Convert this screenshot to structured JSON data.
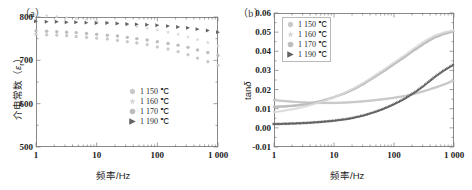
{
  "figure": {
    "panel_a_tag": "（a）",
    "panel_b_tag": "（b）"
  },
  "series_colors": {
    "t1150": "#c9c9c9",
    "t1160": "#d8d8d8",
    "t1170": "#bdbdbd",
    "t1190": "#626262"
  },
  "legend": {
    "items": [
      {
        "label": "1 150 ℃",
        "marker": "hexagon-marker",
        "color": "#c9c9c9"
      },
      {
        "label": "1 160 ℃",
        "marker": "star-marker",
        "color": "#d8d8d8"
      },
      {
        "label": "1 170 ℃",
        "marker": "circle-marker",
        "color": "#bdbdbd"
      },
      {
        "label": "1 190 ℃",
        "marker": "right-triangle-marker",
        "color": "#626262"
      }
    ]
  },
  "chart_data": [
    {
      "type": "scatter",
      "panel": "a",
      "title": "",
      "xlabel": "频率/Hz",
      "ylabel": "介电常数（ε_r）",
      "xscale": "log",
      "xlim": [
        1,
        1000
      ],
      "ylim": [
        500,
        800
      ],
      "xticks": [
        1,
        10,
        100,
        1000
      ],
      "xticklabels": [
        "1",
        "10",
        "100",
        "1 000"
      ],
      "yticks": [
        500,
        600,
        700,
        800
      ],
      "yticklabels": [
        "500",
        "600",
        "700",
        "800"
      ],
      "grid": false,
      "legend_position": "lower-right",
      "x": [
        1,
        1.5,
        2.2,
        3.2,
        4.6,
        6.8,
        10,
        15,
        22,
        32,
        46,
        68,
        100,
        150,
        220,
        320,
        460,
        680,
        1000
      ],
      "series": [
        {
          "name": "1 150 ℃",
          "marker": "hexagon",
          "color": "#c9c9c9",
          "values": [
            760,
            759,
            758,
            757,
            755,
            753,
            751,
            749,
            746,
            743,
            740,
            736,
            731,
            726,
            720,
            713,
            705,
            697,
            688
          ]
        },
        {
          "name": "1 160 ℃",
          "marker": "star",
          "color": "#d8d8d8",
          "values": [
            805,
            803,
            801,
            799,
            797,
            794,
            791,
            788,
            785,
            782,
            778,
            774,
            770,
            765,
            760,
            754,
            748,
            741,
            733
          ]
        },
        {
          "name": "1 170 ℃",
          "marker": "circle",
          "color": "#bdbdbd",
          "values": [
            768,
            767,
            766,
            765,
            764,
            762,
            760,
            758,
            756,
            753,
            750,
            747,
            743,
            739,
            735,
            730,
            724,
            718,
            711
          ]
        },
        {
          "name": "1 190 ℃",
          "marker": "right-triangle",
          "color": "#626262",
          "values": [
            790,
            789,
            789,
            788,
            788,
            787,
            786,
            786,
            785,
            784,
            783,
            782,
            781,
            779,
            777,
            775,
            772,
            769,
            765
          ]
        }
      ]
    },
    {
      "type": "line",
      "panel": "b",
      "title": "",
      "xlabel": "频率/Hz",
      "ylabel": "tanδ",
      "xscale": "log",
      "xlim": [
        1,
        1000
      ],
      "ylim": [
        -0.01,
        0.06
      ],
      "xticks": [
        1,
        10,
        100,
        1000
      ],
      "xticklabels": [
        "1",
        "10",
        "100",
        "1 000"
      ],
      "yticks": [
        -0.01,
        0,
        0.01,
        0.02,
        0.03,
        0.04,
        0.05,
        0.06
      ],
      "yticklabels": [
        "-0.01",
        "0.00",
        "0.01",
        "0.02",
        "0.03",
        "0.04",
        "0.05",
        "0.06"
      ],
      "grid": false,
      "legend_position": "upper-left",
      "x": [
        1,
        1.5,
        2.2,
        3.2,
        4.6,
        6.8,
        10,
        15,
        22,
        32,
        46,
        68,
        100,
        150,
        220,
        320,
        460,
        680,
        1000
      ],
      "series": [
        {
          "name": "1 150 ℃",
          "marker": "hexagon",
          "color": "#c9c9c9",
          "values": [
            0.0145,
            0.014,
            0.0136,
            0.0133,
            0.0131,
            0.013,
            0.013,
            0.0132,
            0.0135,
            0.0139,
            0.0144,
            0.015,
            0.0157,
            0.0166,
            0.0178,
            0.0192,
            0.0208,
            0.0226,
            0.0248
          ]
        },
        {
          "name": "1 160 ℃",
          "marker": "star",
          "color": "#d8d8d8",
          "values": [
            0.0082,
            0.009,
            0.0099,
            0.011,
            0.0124,
            0.0141,
            0.016,
            0.0183,
            0.0209,
            0.0238,
            0.027,
            0.0305,
            0.0341,
            0.0379,
            0.0417,
            0.0452,
            0.048,
            0.0499,
            0.051
          ]
        },
        {
          "name": "1 170 ℃",
          "marker": "circle",
          "color": "#bdbdbd",
          "values": [
            0.011,
            0.0112,
            0.0116,
            0.0122,
            0.0131,
            0.0144,
            0.016,
            0.018,
            0.0204,
            0.0232,
            0.0263,
            0.0297,
            0.0333,
            0.037,
            0.0407,
            0.0441,
            0.047,
            0.0491,
            0.0505
          ]
        },
        {
          "name": "1 190 ℃",
          "marker": "right-triangle",
          "color": "#626262",
          "values": [
            0.002,
            0.0021,
            0.0023,
            0.0025,
            0.0028,
            0.0032,
            0.0037,
            0.0044,
            0.0053,
            0.0065,
            0.008,
            0.0099,
            0.0122,
            0.015,
            0.0183,
            0.022,
            0.026,
            0.0298,
            0.033
          ]
        }
      ]
    }
  ]
}
